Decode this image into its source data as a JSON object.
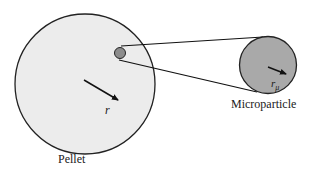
{
  "diagram": {
    "pellet": {
      "label": "Pellet",
      "radius_label": "r",
      "fill": "#ececec",
      "stroke": "#222222"
    },
    "microparticle": {
      "label": "Microparticle",
      "radius_label": "r",
      "radius_subscript": "μ",
      "fill": "#a9a9a9",
      "stroke": "#222222"
    },
    "inset_particle": {
      "fill": "#8c8c8c"
    }
  }
}
